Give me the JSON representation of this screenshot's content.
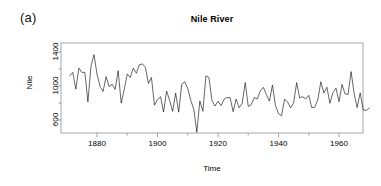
{
  "panel": {
    "label": "(a)"
  },
  "chart_data": {
    "type": "line",
    "title": "Nile River",
    "xlabel": "Time",
    "ylabel": "Nile",
    "grid": false,
    "legend": null,
    "xlim": [
      1871,
      1970
    ],
    "ylim": [
      456,
      1370
    ],
    "xticks": [
      1880,
      1900,
      1920,
      1940,
      1960
    ],
    "xtick_labels": [
      "1880",
      "1900",
      "1920",
      "1940",
      "1960"
    ],
    "xminor_ticks": [
      1890,
      1910,
      1930,
      1950,
      1970
    ],
    "yticks": [
      600,
      1000,
      1400
    ],
    "ytick_labels": [
      "600",
      "1000",
      "1400"
    ],
    "yminor_ticks": [
      800,
      1200
    ],
    "line_color": "#000000",
    "line_width": 0.6,
    "x": [
      1871,
      1872,
      1873,
      1874,
      1875,
      1876,
      1877,
      1878,
      1879,
      1880,
      1881,
      1882,
      1883,
      1884,
      1885,
      1886,
      1887,
      1888,
      1889,
      1890,
      1891,
      1892,
      1893,
      1894,
      1895,
      1896,
      1897,
      1898,
      1899,
      1900,
      1901,
      1902,
      1903,
      1904,
      1905,
      1906,
      1907,
      1908,
      1909,
      1910,
      1911,
      1912,
      1913,
      1914,
      1915,
      1916,
      1917,
      1918,
      1919,
      1920,
      1921,
      1922,
      1923,
      1924,
      1925,
      1926,
      1927,
      1928,
      1929,
      1930,
      1931,
      1932,
      1933,
      1934,
      1935,
      1936,
      1937,
      1938,
      1939,
      1940,
      1941,
      1942,
      1943,
      1944,
      1945,
      1946,
      1947,
      1948,
      1949,
      1950,
      1951,
      1952,
      1953,
      1954,
      1955,
      1956,
      1957,
      1958,
      1959,
      1960,
      1961,
      1962,
      1963,
      1964,
      1965,
      1966,
      1967,
      1968,
      1969,
      1970
    ],
    "values": [
      1120,
      1160,
      963,
      1210,
      1160,
      1160,
      813,
      1230,
      1370,
      1140,
      995,
      935,
      1110,
      994,
      1020,
      960,
      1180,
      799,
      958,
      1140,
      1100,
      1210,
      1150,
      1250,
      1260,
      1220,
      1030,
      1100,
      774,
      840,
      874,
      694,
      940,
      833,
      701,
      916,
      692,
      1020,
      1050,
      969,
      831,
      726,
      456,
      824,
      702,
      1120,
      1100,
      832,
      764,
      821,
      768,
      845,
      864,
      862,
      698,
      845,
      744,
      796,
      1040,
      759,
      781,
      865,
      845,
      944,
      984,
      897,
      822,
      1010,
      771,
      676,
      649,
      846,
      812,
      742,
      801,
      1040,
      860,
      874,
      848,
      890,
      744,
      749,
      838,
      1050,
      918,
      986,
      797,
      923,
      975,
      815,
      1020,
      906,
      901,
      1170,
      912,
      746,
      919,
      718,
      714,
      740
    ],
    "series_name": "Nile"
  }
}
